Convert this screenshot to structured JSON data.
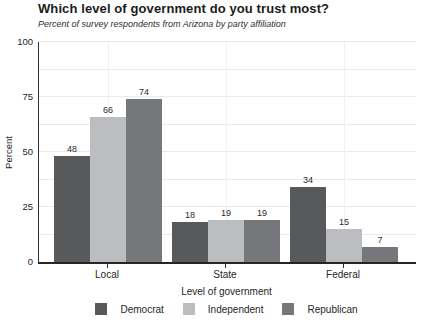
{
  "title": "Which level of government do you trust most?",
  "subtitle": "Percent of survey respondents from Arizona by party affiliation",
  "chart_data": {
    "type": "bar",
    "title": "Which level of government do you trust most?",
    "subtitle": "Percent of survey respondents from Arizona by party affiliation",
    "categories": [
      "Local",
      "State",
      "Federal"
    ],
    "series": [
      {
        "name": "Democrat",
        "color": "#58595b",
        "values": [
          48,
          18,
          34
        ]
      },
      {
        "name": "Independent",
        "color": "#bcbdc0",
        "values": [
          66,
          19,
          15
        ]
      },
      {
        "name": "Republican",
        "color": "#76777a",
        "values": [
          74,
          19,
          7
        ]
      }
    ],
    "xlabel": "Level of government",
    "ylabel": "Percent",
    "ylim": [
      0,
      100
    ],
    "yticks": [
      0,
      25,
      50,
      75,
      100
    ],
    "minor_grid_step": 12.5,
    "grid": true,
    "legend_position": "bottom",
    "bar_value_labels": true
  }
}
